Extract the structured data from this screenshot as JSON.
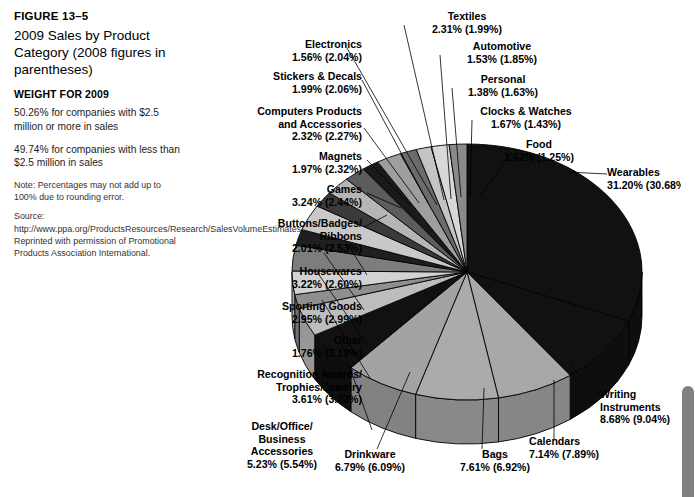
{
  "caption": {
    "figure_number": "FIGURE 13–5",
    "title": "2009 Sales by Product Category (2008 figures in parentheses)",
    "weight_heading": "WEIGHT FOR 2009",
    "weight_line_1": "50.26% for companies with $2.5 million or more in sales",
    "weight_line_2": "49.74% for companies with less than $2.5 million in sales",
    "note": "Note: Percentages may not add up to 100% due to rounding error.",
    "source": "Source: http://www.ppa.org/ProductsResources/Research/SalesVolumeEstimates/2010. Reprinted with permission of Promotional Products Association International."
  },
  "chart_data": {
    "type": "pie",
    "title": "2009 Sales by Product Category (2008 figures in parentheses)",
    "value_unit": "percent",
    "legend": "none",
    "labels_format": "{name} {v2009}% ({v2008}%)",
    "categories": [
      "Wearables",
      "Writing Instruments",
      "Calendars",
      "Bags",
      "Drinkware",
      "Desk/Office/Business Accessories",
      "Recognition Awards/Trophies/Jewelry",
      "Other",
      "Sporting Goods",
      "Housewares",
      "Buttons/Badges/Ribbons",
      "Games",
      "Magnets",
      "Computers Products and Accessories",
      "Stickers & Decals",
      "Electronics",
      "Textiles",
      "Automotive",
      "Personal",
      "Clocks & Watches",
      "Food"
    ],
    "values": [
      31.2,
      8.68,
      7.14,
      7.61,
      6.79,
      5.23,
      3.61,
      1.76,
      2.95,
      3.22,
      2.01,
      3.24,
      1.97,
      2.32,
      1.99,
      1.56,
      2.31,
      1.53,
      1.38,
      1.67,
      1.62
    ],
    "values_2008": [
      30.68,
      9.04,
      7.89,
      6.92,
      6.09,
      5.54,
      3.23,
      3.19,
      2.99,
      2.6,
      2.53,
      2.44,
      2.32,
      2.27,
      2.06,
      2.04,
      1.99,
      1.85,
      1.63,
      1.43,
      1.25
    ],
    "slices": [
      {
        "name": "Wearables",
        "v2009": "31.20",
        "v2008": "30.68",
        "label": "Wearables",
        "value_text": "31.20% (30.68%)",
        "color": "#111111"
      },
      {
        "name": "Writing Instruments",
        "v2009": "8.68",
        "v2008": "9.04",
        "label": "Writing\nInstruments",
        "value_text": "8.68% (9.04%)",
        "color": "#111111"
      },
      {
        "name": "Calendars",
        "v2009": "7.14",
        "v2008": "7.89",
        "label": "Calendars",
        "value_text": "7.14% (7.89%)",
        "color": "#a8a8a8"
      },
      {
        "name": "Bags",
        "v2009": "7.61",
        "v2008": "6.92",
        "label": "Bags",
        "value_text": "7.61% (6.92%)",
        "color": "#ababab"
      },
      {
        "name": "Drinkware",
        "v2009": "6.79",
        "v2008": "6.09",
        "label": "Drinkware",
        "value_text": "6.79% (6.09%)",
        "color": "#a3a3a3"
      },
      {
        "name": "Desk/Office/Business Accessories",
        "v2009": "5.23",
        "v2008": "5.54",
        "label": "Desk/Office/\nBusiness\nAccessories",
        "value_text": "5.23% (5.54%)",
        "color": "#111111"
      },
      {
        "name": "Recognition Awards/Trophies/Jewelry",
        "v2009": "3.61",
        "v2008": "3.23",
        "label": "Recognition Awards/\nTrophies/Jewelry",
        "value_text": "3.61% (3.23%)",
        "color": "#bdbdbd"
      },
      {
        "name": "Other",
        "v2009": "1.76",
        "v2008": "3.19",
        "label": "Other",
        "value_text": "1.76% (3.19%)",
        "color": "#8f8f8f"
      },
      {
        "name": "Sporting Goods",
        "v2009": "2.95",
        "v2008": "2.99",
        "label": "Sporting Goods",
        "value_text": "2.95% (2.99%)",
        "color": "#d2d2d2"
      },
      {
        "name": "Housewares",
        "v2009": "3.22",
        "v2008": "2.60",
        "label": "Housewares",
        "value_text": "3.22% (2.60%)",
        "color": "#7d7d7d"
      },
      {
        "name": "Buttons/Badges/Ribbons",
        "v2009": "2.01",
        "v2008": "2.53",
        "label": "Buttons/Badges/\nRibbons",
        "value_text": "2.01% (2.53%)",
        "color": "#1f1f1f"
      },
      {
        "name": "Games",
        "v2009": "3.24",
        "v2008": "2.44",
        "label": "Games",
        "value_text": "3.24% (2.44%)",
        "color": "#c9c9c9"
      },
      {
        "name": "Magnets",
        "v2009": "1.97",
        "v2008": "2.32",
        "label": "Magnets",
        "value_text": "1.97% (2.32%)",
        "color": "#3a3a3a"
      },
      {
        "name": "Computers Products and Accessories",
        "v2009": "2.32",
        "v2008": "2.27",
        "label": "Computers Products\nand Accessories",
        "value_text": "2.32% (2.27%)",
        "color": "#b5b5b5"
      },
      {
        "name": "Stickers & Decals",
        "v2009": "1.99",
        "v2008": "2.06",
        "label": "Stickers & Decals",
        "value_text": "1.99% (2.06%)",
        "color": "#5c5c5c"
      },
      {
        "name": "Electronics",
        "v2009": "1.56",
        "v2008": "2.04",
        "label": "Electronics",
        "value_text": "1.56% (2.04%)",
        "color": "#1a1a1a"
      },
      {
        "name": "Textiles",
        "v2009": "2.31",
        "v2008": "1.99",
        "label": "Textiles",
        "value_text": "2.31% (1.99%)",
        "color": "#9e9e9e"
      },
      {
        "name": "Automotive",
        "v2009": "1.53",
        "v2008": "1.85",
        "label": "Automotive",
        "value_text": "1.53% (1.85%)",
        "color": "#6b6b6b"
      },
      {
        "name": "Personal",
        "v2009": "1.38",
        "v2008": "1.63",
        "label": "Personal",
        "value_text": "1.38% (1.63%)",
        "color": "#c4c4c4"
      },
      {
        "name": "Clocks & Watches",
        "v2009": "1.67",
        "v2008": "1.43",
        "label": "Clocks & Watches",
        "value_text": "1.67% (1.43%)",
        "color": "#d8d8d8"
      },
      {
        "name": "Food",
        "v2009": "1.62",
        "v2008": "1.25",
        "label": "Food",
        "value_text": "1.62% (1.25%)",
        "color": "#8a8a8a"
      }
    ]
  },
  "scrollbar": {
    "position": "right",
    "thumb_state": "at-bottom"
  }
}
